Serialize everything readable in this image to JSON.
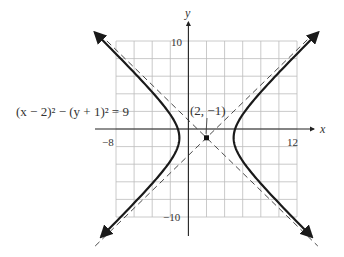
{
  "chart_data": {
    "type": "line",
    "title": "",
    "equation": "(x − 2)² − (y + 1)² = 9",
    "center": {
      "x": 2,
      "y": -1,
      "label": "(2, −1)"
    },
    "a": 3,
    "b": 3,
    "asymptotes": [
      "y + 1 = x − 2",
      "y + 1 = −(x − 2)"
    ],
    "vertices": [
      {
        "x": -1,
        "y": -1
      },
      {
        "x": 5,
        "y": -1
      }
    ],
    "xlabel": "x",
    "ylabel": "y",
    "xlim": [
      -8,
      12
    ],
    "ylim": [
      -10,
      10
    ],
    "grid": true,
    "grid_step": 2,
    "tick_labels": {
      "x": [
        "−8",
        "12"
      ],
      "y": [
        "10",
        "−10"
      ]
    },
    "series": [
      {
        "name": "right branch",
        "style": "solid"
      },
      {
        "name": "left branch",
        "style": "solid"
      },
      {
        "name": "asymptote +",
        "style": "dashed"
      },
      {
        "name": "asymptote −",
        "style": "dashed"
      }
    ],
    "colors": {
      "curve": "#1a1a1a",
      "asymptote": "#4a4a4a",
      "grid": "#bdbdbd",
      "axis": "#222222"
    }
  },
  "labels": {
    "x_axis": "x",
    "y_axis": "y",
    "x_min": "−8",
    "x_max": "12",
    "y_max": "10",
    "y_min": "−10",
    "equation": "(x − 2)² − (y + 1)² = 9",
    "center": "(2, −1)"
  }
}
